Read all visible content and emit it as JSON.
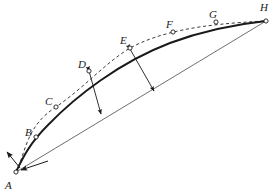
{
  "figure": {
    "background_color": "#ffffff",
    "ink_color": "#1a1a1a",
    "thin_line_color": "#555555",
    "width": 276,
    "height": 196,
    "points": [
      {
        "label": "A",
        "cx": 16,
        "cy": 172,
        "lx": 5,
        "ly": 180,
        "marker": "open-circle"
      },
      {
        "label": "B",
        "cx": 36,
        "cy": 137,
        "lx": 25,
        "ly": 127,
        "marker": "open-circle"
      },
      {
        "label": "C",
        "cx": 56,
        "cy": 107,
        "lx": 45,
        "ly": 96,
        "marker": "open-circle"
      },
      {
        "label": "D",
        "cx": 89,
        "cy": 71,
        "lx": 78,
        "ly": 59,
        "marker": "open-circle"
      },
      {
        "label": "E",
        "cx": 130,
        "cy": 48,
        "lx": 120,
        "ly": 35,
        "marker": "open-circle"
      },
      {
        "label": "F",
        "cx": 173,
        "cy": 32,
        "lx": 166,
        "ly": 19,
        "marker": "open-circle"
      },
      {
        "label": "G",
        "cx": 216,
        "cy": 22,
        "lx": 209,
        "ly": 9,
        "marker": "open-circle"
      },
      {
        "label": "H",
        "cx": 266,
        "cy": 21,
        "lx": 260,
        "ly": 2,
        "marker": "open-circle"
      }
    ],
    "curves": {
      "dashed_upper": {
        "name": "dashed-upper-curve",
        "style": "dashed",
        "path": "M 16 172 C 26 152 26 126 56 107 C 86 86 104 64 130 48 C 160 32 200 24 266 21"
      },
      "solid_thick": {
        "name": "solid-thick-curve",
        "style": "solid-thick",
        "path": "M 16 172 C 23 157 30 143 48 125 C 76 96 120 62 170 43 C 202 31 238 24 266 21"
      },
      "straight_chord": {
        "name": "straight-chord-line",
        "style": "thin-straight",
        "path": "M 16 172 L 266 21"
      }
    },
    "measure_arrows": [
      {
        "name": "arrow-d-to-chord",
        "x1": 89,
        "y1": 71,
        "x2": 101,
        "y2": 114
      },
      {
        "name": "arrow-e-to-chord",
        "x1": 130,
        "y1": 49,
        "x2": 154,
        "y2": 91
      }
    ],
    "origin_arrows": [
      {
        "name": "tangent-arrow-at-a",
        "x1": 20,
        "y1": 168,
        "x2": 7,
        "y2": 152
      },
      {
        "name": "chord-arrow-at-a",
        "x1": 48,
        "y1": 161,
        "x2": 21,
        "y2": 170
      }
    ]
  }
}
